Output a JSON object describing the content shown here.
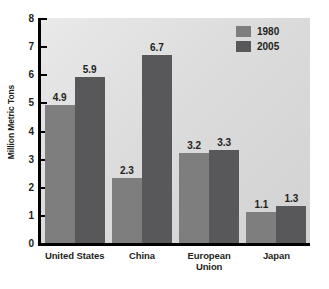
{
  "chart_data": {
    "type": "bar",
    "title": "",
    "xlabel": "",
    "ylabel": "Million Metric Tons",
    "categories": [
      "United States",
      "China",
      "European Union",
      "Japan"
    ],
    "series": [
      {
        "name": "1980",
        "values": [
          4.9,
          2.3,
          3.2,
          1.1
        ],
        "color": "#7e7e7e"
      },
      {
        "name": "2005",
        "values": [
          5.9,
          6.7,
          3.3,
          1.3
        ],
        "color": "#58585a"
      }
    ],
    "ylim": [
      0,
      8
    ],
    "yticks": [
      0,
      1,
      2,
      3,
      4,
      5,
      6,
      7,
      8
    ],
    "ytick_labels": [
      "0",
      "1",
      "2",
      "3",
      "4",
      "5",
      "6",
      "7",
      "8"
    ],
    "grid": false,
    "legend_position": "top-right",
    "data_labels": true,
    "background": "#dcdcdc",
    "axis_color": "#000000",
    "text_color": "#231f20"
  }
}
